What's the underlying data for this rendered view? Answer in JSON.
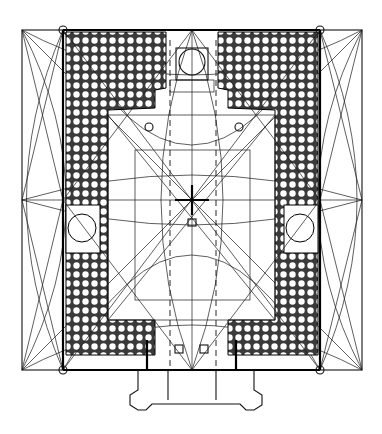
{
  "drawing": {
    "title": "",
    "type": "architectural-plan",
    "colors": {
      "ink": "#000000",
      "paper": "#ffffff",
      "grid_fill": "#3a3a3a"
    },
    "outer_square": {
      "x1": 22,
      "y1": 30,
      "x2": 362,
      "y2": 370
    },
    "building_walls": {
      "x1": 63,
      "y1": 30,
      "x2": 320,
      "y2": 370
    },
    "courtyard": {
      "x1": 108,
      "y1": 115,
      "x2": 275,
      "y2": 320
    },
    "inner_square": {
      "x1": 135,
      "y1": 150,
      "x2": 250,
      "y2": 300
    },
    "axes": {
      "cx": 192,
      "cy": 200,
      "dashed_x": [
        170,
        216
      ]
    },
    "corner_circles": [
      [
        63,
        30
      ],
      [
        320,
        30
      ],
      [
        63,
        370
      ],
      [
        320,
        370
      ]
    ],
    "side_domes": [
      [
        82,
        228
      ],
      [
        300,
        228
      ]
    ],
    "top_dome": [
      192,
      62
    ],
    "entrance": {
      "x1": 147,
      "y1": 370,
      "x2": 236,
      "y2": 410,
      "porch_left": [
        138,
        403
      ],
      "porch_right": [
        246,
        403
      ]
    }
  }
}
